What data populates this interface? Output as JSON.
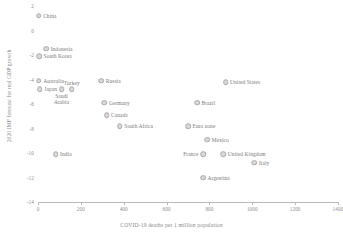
{
  "chart_data": {
    "type": "scatter",
    "title": "",
    "xlabel": "COVID-19 deaths per 1 million population",
    "ylabel": "2020 IMF forecast for real GDP growth",
    "xlim": [
      0,
      1400
    ],
    "ylim": [
      -14,
      2
    ],
    "xticks": [
      0,
      200,
      400,
      600,
      800,
      1000,
      1200,
      1400
    ],
    "xtick_labels": [
      "0",
      "200",
      "400",
      "600",
      "800",
      "1000",
      "1200",
      "1400"
    ],
    "yticks": [
      2,
      0,
      -2,
      -4,
      -6,
      -8,
      -10,
      -12,
      -14
    ],
    "ytick_labels": [
      "2",
      "0",
      "-2",
      "-4",
      "-6",
      "-8",
      "-10",
      "-12",
      "-14"
    ],
    "grid": false,
    "legend": "none",
    "marker_color": "#d9d9d9",
    "marker_edge_color": "#a8a8a8",
    "axis_color": "#b9b9b9",
    "text_color": "#787878",
    "background": "#ffffff",
    "points": [
      {
        "label": "China",
        "x": 3,
        "y": 1.2,
        "pos": "right"
      },
      {
        "label": "Indonesia",
        "x": 38,
        "y": -1.5,
        "pos": "right"
      },
      {
        "label": "South Korea",
        "x": 5,
        "y": -2.1,
        "pos": "right"
      },
      {
        "label": "Australia",
        "x": 4,
        "y": -4.1,
        "pos": "right"
      },
      {
        "label": "Russia",
        "x": 295,
        "y": -4.1,
        "pos": "right"
      },
      {
        "label": "United States",
        "x": 875,
        "y": -4.2,
        "pos": "right"
      },
      {
        "label": "Japan",
        "x": 8,
        "y": -4.8,
        "pos": "right"
      },
      {
        "label": "Saudi Arabia",
        "x": 110,
        "y": -4.8,
        "pos": "below"
      },
      {
        "label": "Turkey",
        "x": 158,
        "y": -4.8,
        "pos": "above"
      },
      {
        "label": "Germany",
        "x": 310,
        "y": -5.9,
        "pos": "right"
      },
      {
        "label": "Brazil",
        "x": 742,
        "y": -5.9,
        "pos": "right"
      },
      {
        "label": "Canada",
        "x": 320,
        "y": -6.9,
        "pos": "right"
      },
      {
        "label": "South Africa",
        "x": 382,
        "y": -7.8,
        "pos": "right"
      },
      {
        "label": "Euro zone",
        "x": 700,
        "y": -7.8,
        "pos": "right"
      },
      {
        "label": "Mexico",
        "x": 790,
        "y": -8.9,
        "pos": "right"
      },
      {
        "label": "India",
        "x": 82,
        "y": -10.1,
        "pos": "right"
      },
      {
        "label": "France",
        "x": 770,
        "y": -10.1,
        "pos": "left"
      },
      {
        "label": "United Kingdom",
        "x": 865,
        "y": -10.1,
        "pos": "right"
      },
      {
        "label": "Italy",
        "x": 1010,
        "y": -10.8,
        "pos": "right"
      },
      {
        "label": "Argentina",
        "x": 770,
        "y": -12.0,
        "pos": "right"
      }
    ]
  }
}
